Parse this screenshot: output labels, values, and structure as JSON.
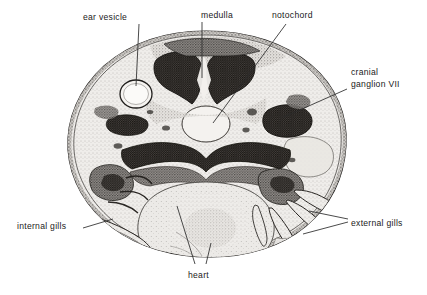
{
  "figure": {
    "background_color": "#ffffff",
    "ink_color": "#1a1a1a",
    "specimen_outline_color": "#262626",
    "specimen_fill_color": "#e8e6e2"
  },
  "labels": [
    {
      "id": "ear-vesicle",
      "text": "ear vesicle",
      "x": 83,
      "y": 12,
      "align": "left",
      "lines": 1
    },
    {
      "id": "medulla",
      "text": "medulla",
      "x": 201,
      "y": 10,
      "align": "left",
      "lines": 1
    },
    {
      "id": "notochord",
      "text": "notochord",
      "x": 272,
      "y": 10,
      "align": "left",
      "lines": 1
    },
    {
      "id": "cranial-ganglion-vii",
      "text": "cranial",
      "text2": "ganglion VII",
      "x": 351,
      "y": 67,
      "align": "left",
      "lines": 2
    },
    {
      "id": "internal-gills",
      "text": "internal gills",
      "x": 17,
      "y": 221,
      "align": "left",
      "lines": 1
    },
    {
      "id": "external-gills",
      "text": "external gills",
      "x": 351,
      "y": 218,
      "align": "left",
      "lines": 1
    },
    {
      "id": "heart",
      "text": "heart",
      "x": 188,
      "y": 270,
      "align": "left",
      "lines": 1
    }
  ],
  "leader_lines": [
    {
      "id": "leader-ear-vesicle",
      "points": "139,24 136,86"
    },
    {
      "id": "leader-medulla",
      "points": "202,22 202,78"
    },
    {
      "id": "leader-notochord",
      "points": "286,24 213,123"
    },
    {
      "id": "leader-cranial-ganglion",
      "points": "347,89 284,117"
    },
    {
      "id": "leader-internal-gills",
      "points": "83,228 113,219"
    },
    {
      "id": "leader-external-gills-a",
      "points": "348,219 309,211"
    },
    {
      "id": "leader-external-gills-b",
      "points": "348,222 303,234"
    },
    {
      "id": "leader-heart-a",
      "points": "177,206 195,264"
    },
    {
      "id": "leader-heart-b",
      "points": "211,243 206,264"
    }
  ],
  "structures": [
    {
      "id": "specimen-body",
      "name": "embryo cross-section body"
    },
    {
      "id": "ear-vesicle-cavity",
      "name": "ear vesicle (otic vesicle) lumen"
    },
    {
      "id": "medulla-left-lobe",
      "name": "medulla left lobe"
    },
    {
      "id": "medulla-right-lobe",
      "name": "medulla right lobe"
    },
    {
      "id": "notochord-body",
      "name": "notochord"
    },
    {
      "id": "cranial-ganglion-mass",
      "name": "cranial ganglion VII"
    },
    {
      "id": "pharynx-band",
      "name": "pharyngeal roof band"
    },
    {
      "id": "heart-mass",
      "name": "heart"
    },
    {
      "id": "internal-gill-arches",
      "name": "internal gill arches"
    },
    {
      "id": "external-gill-filaments",
      "name": "external gill filaments"
    }
  ]
}
